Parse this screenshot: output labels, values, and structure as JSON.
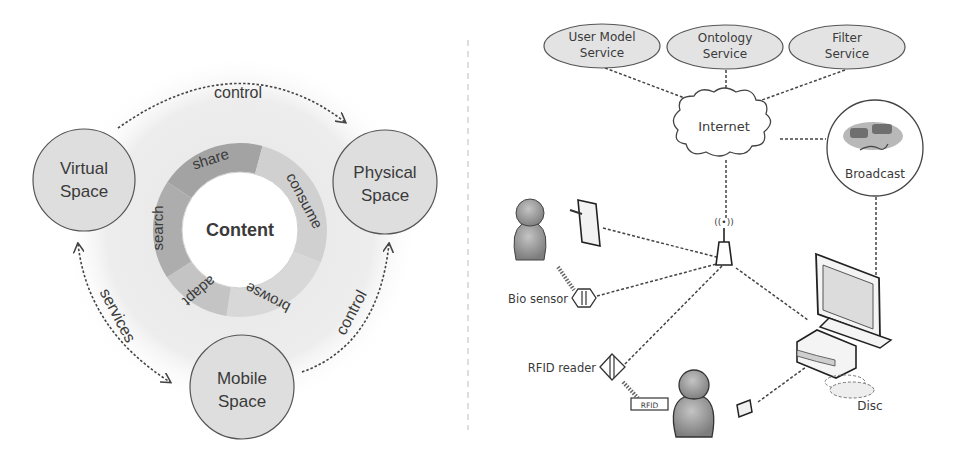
{
  "left_diagram": {
    "title": "Content ecosystem",
    "center_label": "Content",
    "ring_segments": [
      {
        "label": "share",
        "color": "#a6a6a6"
      },
      {
        "label": "consume",
        "color": "#d2d2d2"
      },
      {
        "label": "browse",
        "color": "#d9d9d9"
      },
      {
        "label": "adapt",
        "color": "#c6c6c6"
      },
      {
        "label": "search",
        "color": "#b1b1b1"
      }
    ],
    "spaces": [
      {
        "id": "virtual",
        "line1": "Virtual",
        "line2": "Space"
      },
      {
        "id": "physical",
        "line1": "Physical",
        "line2": "Space"
      },
      {
        "id": "mobile",
        "line1": "Mobile",
        "line2": "Space"
      }
    ],
    "edges": [
      {
        "from": "virtual",
        "to": "physical",
        "label": "control"
      },
      {
        "from": "virtual",
        "to": "mobile",
        "label": "services",
        "bidirectional": true
      },
      {
        "from": "mobile",
        "to": "physical",
        "label": "control"
      }
    ]
  },
  "right_diagram": {
    "services": [
      {
        "line1": "User Model",
        "line2": "Service"
      },
      {
        "line1": "Ontology",
        "line2": "Service"
      },
      {
        "line1": "Filter",
        "line2": "Service"
      }
    ],
    "cloud_label": "Internet",
    "broadcast_label": "Broadcast",
    "bio_sensor_label": "Bio sensor",
    "rfid_reader_label": "RFID reader",
    "rfid_tag_label": "RFID",
    "disc_label": "Disc",
    "antenna_symbol": "((•))"
  },
  "colors": {
    "space_fill": "#dedede",
    "halo": "#ececec",
    "stroke": "#555555",
    "person_fill": "#9a9a9a"
  }
}
